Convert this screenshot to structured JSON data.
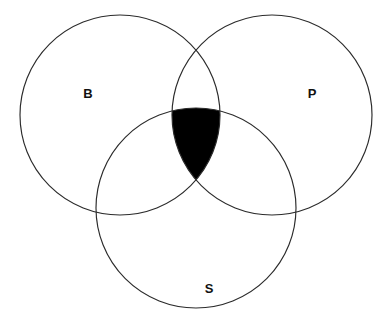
{
  "figure": {
    "kind": "venn-diagram",
    "background_color": "#ffffff",
    "stroke_color": "#2b2b2b",
    "stroke_width": 1.15,
    "width": 392,
    "height": 327
  },
  "sets": [
    {
      "id": "B",
      "label": "B",
      "cx": 120,
      "cy": 115,
      "r": 100,
      "label_x": 88,
      "label_y": 95
    },
    {
      "id": "P",
      "label": "P",
      "cx": 272,
      "cy": 115,
      "r": 100,
      "label_x": 312,
      "label_y": 95
    },
    {
      "id": "S",
      "label": "S",
      "cx": 196,
      "cy": 208,
      "r": 100,
      "label_x": 209,
      "label_y": 290
    }
  ],
  "shaded_regions": [
    {
      "id": "B-and-P-and-S",
      "description": "triple intersection of B, P and S",
      "fill_color": "#000000"
    }
  ],
  "chart_data": {
    "type": "venn",
    "title": "",
    "sets": [
      "B",
      "P",
      "S"
    ],
    "set_labels": [
      "B",
      "P",
      "S"
    ],
    "shaded": [
      "B∩P∩S"
    ],
    "unshaded": [
      "B only",
      "P only",
      "S only",
      "B∩P only",
      "B∩S only",
      "P∩S only"
    ],
    "shaded_fill": "#000000",
    "outline_color": "#2b2b2b",
    "background": "#ffffff",
    "geometry": {
      "radius": 100,
      "centers": [
        [
          120,
          115
        ],
        [
          272,
          115
        ],
        [
          196,
          208
        ]
      ]
    }
  }
}
